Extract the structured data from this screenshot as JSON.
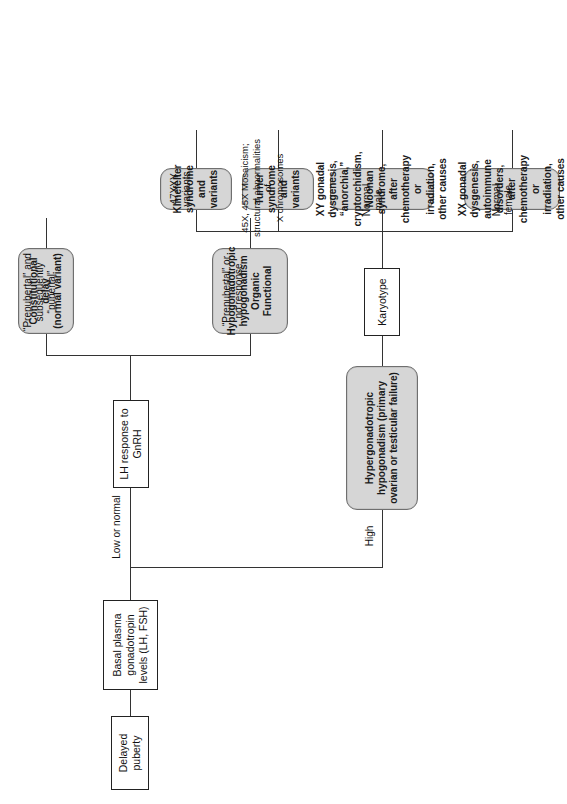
{
  "figure": {
    "type": "clinical-algorithm-flowchart",
    "orientation": "rotated-90-ccw",
    "title_node": "Delayed puberty"
  },
  "nodes": {
    "root": {
      "label": "Delayed puberty",
      "shape": "rect"
    },
    "basal": {
      "label": "Basal plasma gonadotropin\nlevels (LH, FSH)",
      "shape": "rect"
    },
    "lh_gnrh": {
      "label": "LH response to GnRH",
      "shape": "rect"
    },
    "hypergonadotropic": {
      "label": "Hypergonadotropic\nhypogonadism (primary\novarian or testicular failure)",
      "shape": "round"
    },
    "karyotype": {
      "label": "Karyotype",
      "shape": "rect"
    },
    "constitutional_delay": {
      "label": "Constitutional delay\n(normal variant)",
      "shape": "round"
    },
    "hypogonadotropic": {
      "label": "Hypogonadotropic\nhypogonadism\nOrganic\nFunctional",
      "shape": "round"
    },
    "klinefelter": {
      "label": "Klinefelter\nsyndrome\nand variants",
      "shape": "round"
    },
    "turner": {
      "label": "Turner\nsyndrome\nand variants",
      "shape": "round"
    },
    "xy_causes": {
      "label": "XY gonadal dysgenesis,\n“anorchia,”\ncryptorchidism,\nNoonan syndrome,\nafter chemotherapy or\nirradiation,\nother causes",
      "shape": "round"
    },
    "xx_causes": {
      "label": "XX gonadal dysgenesis,\nautoimmune disorders,\nafter chemotherapy or\nirradiation,\nother causes",
      "shape": "round"
    }
  },
  "edge_labels": {
    "low_or_normal": "Low or normal",
    "high": "High",
    "prepubertal_subsequently_pubertal": "“Prepubertal” and\nsubsequently “pubertal”",
    "prepubertal_no_response": "“Prepubertal” or\nno response",
    "karyotype_47xxy": "47XXY\nvariants",
    "karyotype_45x": "45X, 45X Mosaicism;\nstructural abnormalities of\nX chromosomes",
    "normal_male": "Normal male",
    "normal_female": "Normal female"
  },
  "colors": {
    "page_background": "#ffffff",
    "rect_fill": "#ffffff",
    "rect_border": "#222222",
    "round_fill": "#d6d6d6",
    "round_border": "#6f6f6f",
    "line": "#333333",
    "text": "#111111"
  }
}
